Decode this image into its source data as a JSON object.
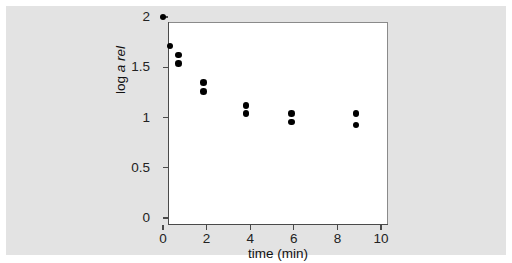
{
  "figure": {
    "background_color": "#ffffff",
    "panel_color": "#e3e3e3",
    "plot_background_color": "#ffffff",
    "marker_color": "#000000",
    "axis_color": "#4a4a4a"
  },
  "chart_data": {
    "type": "scatter",
    "title": "",
    "xlabel": "time (min)",
    "ylabel": "log a rel",
    "ylabel_parts": {
      "prefix": "log ",
      "italic": "a rel"
    },
    "xlim": [
      0,
      10
    ],
    "ylim": [
      0,
      2
    ],
    "grid": false,
    "legend": null,
    "xticks": [
      0,
      2,
      4,
      6,
      8,
      10
    ],
    "xtick_labels": [
      "0",
      "2",
      "4",
      "6",
      "8",
      "10"
    ],
    "yticks": [
      0,
      0.5,
      1,
      1.5,
      2
    ],
    "ytick_labels": [
      "0",
      "0.5",
      "1",
      "1.5",
      "2"
    ],
    "series": [
      {
        "name": "log a rel vs time",
        "marker": "circle",
        "color": "#000000",
        "points": [
          {
            "x": 0.0,
            "y": 2.0
          },
          {
            "x": 0.33,
            "y": 1.71
          },
          {
            "x": 0.7,
            "y": 1.62
          },
          {
            "x": 0.7,
            "y": 1.54
          },
          {
            "x": 1.85,
            "y": 1.35
          },
          {
            "x": 1.85,
            "y": 1.26
          },
          {
            "x": 3.8,
            "y": 1.12
          },
          {
            "x": 3.8,
            "y": 1.04
          },
          {
            "x": 5.9,
            "y": 1.04
          },
          {
            "x": 5.9,
            "y": 0.955
          },
          {
            "x": 8.85,
            "y": 1.04
          },
          {
            "x": 8.85,
            "y": 0.925
          }
        ]
      }
    ]
  }
}
